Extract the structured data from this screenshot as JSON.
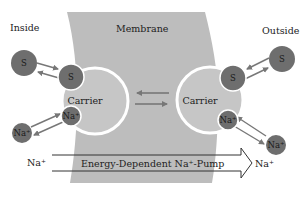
{
  "labels": {
    "inside": "Inside",
    "membrane": "Membrane",
    "outside": "Outside"
  },
  "carriers": {
    "left": "Carrier",
    "right": "Carrier"
  },
  "molecules": {
    "substrate": "S",
    "sodium": "Na⁺"
  },
  "pump": {
    "label": "Energy-Dependent Na⁺-Pump",
    "from": "Na⁺",
    "to": "Na⁺"
  },
  "colors": {
    "membrane": "#bdbdbd",
    "molecule": "#6e6e6e",
    "arrow": "#777777",
    "carrier_ring": "#ffffff",
    "background": "#ffffff"
  }
}
